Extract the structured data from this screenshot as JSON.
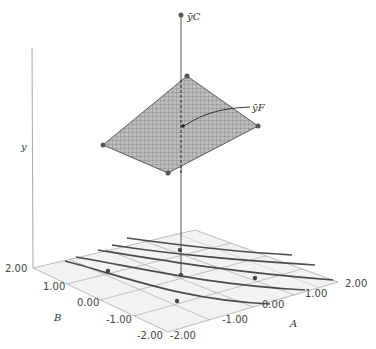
{
  "figure": {
    "type": "3d response surface with contour projection",
    "axes": {
      "x_label": "A",
      "y_label": "B",
      "z_label": "y",
      "A_ticks": [
        "-2.00",
        "-1.00",
        "0.00",
        "1.00",
        "2.00"
      ],
      "B_ticks": [
        "-2.00",
        "-1.00",
        "0.00",
        "1.00",
        "2.00"
      ]
    },
    "annotations": {
      "center_point": "ȳC",
      "factorial_mean": "ȳF"
    }
  },
  "colors": {
    "surface_fill": "#b5b5b5",
    "grid": "#6a6a6a",
    "contour": "#444444",
    "base_plane": "#f0f0f0",
    "points": "#444444"
  }
}
